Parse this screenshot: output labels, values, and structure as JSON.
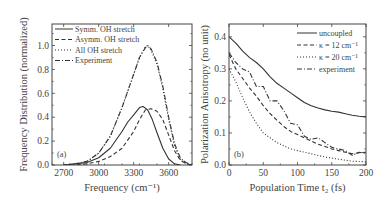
{
  "chart_data": [
    {
      "type": "line",
      "panel_label": "(a)",
      "title": "",
      "xlabel": "Frequency (cm⁻¹)",
      "ylabel": "Frequency Distribution (normalized)",
      "xlim": [
        2600,
        3800
      ],
      "ylim": [
        0,
        1.18
      ],
      "xticks": [
        "2700",
        "3000",
        "3300",
        "3600"
      ],
      "yticks": [
        "0.0",
        "0.2",
        "0.4",
        "0.6",
        "0.8",
        "1.0"
      ],
      "grid": false,
      "legend_position": "upper left",
      "series": [
        {
          "name": "Symm. OH stretch",
          "style": "solid",
          "x": [
            2700,
            2800,
            2900,
            3000,
            3100,
            3200,
            3250,
            3300,
            3350,
            3380,
            3420,
            3460,
            3500,
            3550,
            3600,
            3650,
            3700
          ],
          "y": [
            0.0,
            0.01,
            0.02,
            0.06,
            0.14,
            0.28,
            0.36,
            0.42,
            0.48,
            0.49,
            0.46,
            0.38,
            0.27,
            0.14,
            0.05,
            0.01,
            0.0
          ]
        },
        {
          "name": "Asymm. OH stretch",
          "style": "dashed",
          "x": [
            2700,
            2800,
            2900,
            3000,
            3100,
            3200,
            3300,
            3350,
            3400,
            3450,
            3500,
            3550,
            3600,
            3650,
            3700,
            3750,
            3800
          ],
          "y": [
            0.0,
            0.0,
            0.01,
            0.03,
            0.07,
            0.14,
            0.28,
            0.38,
            0.46,
            0.47,
            0.45,
            0.38,
            0.25,
            0.12,
            0.04,
            0.01,
            0.0
          ]
        },
        {
          "name": "All OH stretch",
          "style": "dotted",
          "x": [
            2700,
            2800,
            2900,
            3000,
            3100,
            3200,
            3300,
            3350,
            3400,
            3420,
            3450,
            3500,
            3550,
            3600,
            3650,
            3700,
            3750,
            3800
          ],
          "y": [
            0.0,
            0.01,
            0.03,
            0.1,
            0.24,
            0.48,
            0.76,
            0.9,
            0.99,
            1.0,
            0.96,
            0.84,
            0.64,
            0.38,
            0.16,
            0.05,
            0.01,
            0.0
          ]
        },
        {
          "name": "Experiment",
          "style": "dashdot",
          "x": [
            2700,
            2800,
            2900,
            3000,
            3100,
            3200,
            3300,
            3350,
            3400,
            3420,
            3450,
            3500,
            3550,
            3600,
            3650,
            3700,
            3750,
            3800
          ],
          "y": [
            0.0,
            0.01,
            0.03,
            0.1,
            0.24,
            0.48,
            0.76,
            0.9,
            0.98,
            1.0,
            0.97,
            0.86,
            0.66,
            0.4,
            0.18,
            0.06,
            0.02,
            0.0
          ]
        }
      ]
    },
    {
      "type": "line",
      "panel_label": "(b)",
      "title": "",
      "xlabel": "Population Time t₂ (fs)",
      "ylabel": "Polarization Anisotropy (no unit)",
      "xlim": [
        0,
        200
      ],
      "ylim": [
        0,
        0.44
      ],
      "xticks": [
        "0",
        "50",
        "100",
        "150",
        "200"
      ],
      "yticks": [
        "0.0",
        "0.1",
        "0.2",
        "0.3",
        "0.4"
      ],
      "grid": false,
      "legend_position": "upper right",
      "series": [
        {
          "name": "uncoupled",
          "style": "solid",
          "x": [
            0,
            10,
            20,
            30,
            40,
            50,
            60,
            70,
            80,
            90,
            100,
            110,
            120,
            130,
            140,
            150,
            160,
            170,
            180,
            190,
            200
          ],
          "y": [
            0.4,
            0.38,
            0.355,
            0.335,
            0.32,
            0.3,
            0.275,
            0.255,
            0.24,
            0.225,
            0.21,
            0.195,
            0.185,
            0.178,
            0.172,
            0.168,
            0.165,
            0.16,
            0.155,
            0.152,
            0.15
          ]
        },
        {
          "name": "κ = 12 cm⁻¹",
          "style": "dashed",
          "x": [
            0,
            10,
            20,
            30,
            40,
            50,
            60,
            70,
            80,
            90,
            100,
            110,
            120,
            130,
            140,
            150,
            160,
            170,
            180,
            190,
            200
          ],
          "y": [
            0.345,
            0.3,
            0.27,
            0.24,
            0.215,
            0.185,
            0.16,
            0.14,
            0.12,
            0.105,
            0.095,
            0.085,
            0.075,
            0.065,
            0.058,
            0.05,
            0.045,
            0.04,
            0.035,
            0.038,
            0.04
          ]
        },
        {
          "name": "κ = 20 cm⁻¹",
          "style": "dotted",
          "x": [
            0,
            10,
            20,
            30,
            40,
            50,
            60,
            70,
            80,
            90,
            100,
            120,
            140,
            160,
            180,
            200
          ],
          "y": [
            0.3,
            0.26,
            0.21,
            0.165,
            0.13,
            0.1,
            0.085,
            0.07,
            0.06,
            0.05,
            0.045,
            0.035,
            0.025,
            0.018,
            0.012,
            0.01
          ]
        },
        {
          "name": "experiment",
          "style": "dashdot",
          "x": [
            0,
            10,
            20,
            30,
            40,
            50,
            60,
            70,
            80,
            90,
            100,
            110,
            120,
            130,
            140,
            150,
            160,
            170,
            180,
            190,
            200
          ],
          "y": [
            0.35,
            0.32,
            0.3,
            0.29,
            0.245,
            0.245,
            0.2,
            0.2,
            0.17,
            0.13,
            0.125,
            0.09,
            0.08,
            0.085,
            0.07,
            0.055,
            0.05,
            0.045,
            0.03,
            0.04,
            0.035
          ]
        }
      ]
    }
  ]
}
